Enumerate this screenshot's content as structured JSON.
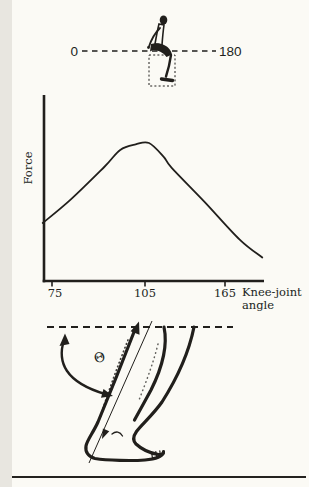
{
  "colors": {
    "background": "#fbfaf5",
    "ink": "#211f1c"
  },
  "labels": {
    "scale_min": "0",
    "scale_max": "180",
    "force_axis": "Force",
    "tick_1": "75",
    "tick_2": "105",
    "tick_3": "165",
    "xlabel_line1": "Knee-joint",
    "xlabel_line2": "angle",
    "theta": "Θ"
  },
  "chart_data": {
    "type": "line",
    "xlabel": "Knee-joint angle",
    "ylabel": "Force",
    "x_tick_labels": [
      75,
      105,
      165
    ],
    "x_range_illustrated": [
      0,
      180
    ],
    "y_tick_labels": [],
    "grid": false,
    "legend": false,
    "ylim": [
      0,
      1.1
    ],
    "series": [
      {
        "name": "Force vs knee-joint angle (relative, unlabeled y-axis)",
        "x": [
          72,
          81,
          92,
          97,
          102,
          108,
          119,
          125,
          150,
          176,
          193
        ],
        "values": [
          0.42,
          0.59,
          0.83,
          0.95,
          0.99,
          1.0,
          0.9,
          0.82,
          0.57,
          0.3,
          0.17
        ]
      }
    ],
    "peak": {
      "x": 108,
      "value": 1.0
    }
  }
}
